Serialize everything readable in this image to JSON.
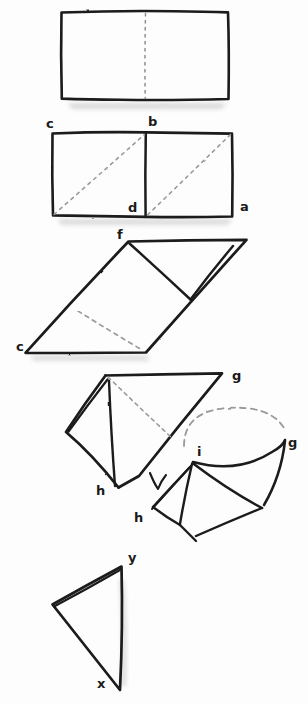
{
  "document": {
    "title": "Origami Fold Sequence",
    "medium": "hand-drawn pencil/ink diagram on white paper",
    "background_color": "#fdfdfd",
    "ink_color": "#1a1a1a",
    "dash_color": "#8a8a8a",
    "shadow_color": "#cfcfcf",
    "width": 308,
    "height": 704
  },
  "steps": [
    {
      "id": "step-1",
      "name": "flat-rectangle-with-center-crease",
      "caption": "",
      "labels": []
    },
    {
      "id": "step-2",
      "name": "rectangle-with-diagonal-creases",
      "caption": "",
      "labels": [
        {
          "text": "c",
          "x": 46,
          "y": 128
        },
        {
          "text": "b",
          "x": 148,
          "y": 126
        },
        {
          "text": "d",
          "x": 128,
          "y": 212
        },
        {
          "text": "a",
          "x": 240,
          "y": 211
        }
      ]
    },
    {
      "id": "step-3",
      "name": "parallelogram-skewed-fold",
      "caption": "",
      "labels": [
        {
          "text": "f",
          "x": 117,
          "y": 239
        },
        {
          "text": "c",
          "x": 16,
          "y": 351
        }
      ]
    },
    {
      "id": "step-4",
      "name": "triangular-flap-fold",
      "caption": "",
      "labels": [
        {
          "text": "g",
          "x": 232,
          "y": 380
        },
        {
          "text": "h",
          "x": 96,
          "y": 495
        }
      ]
    },
    {
      "id": "step-5",
      "name": "cone-rotation-step",
      "caption": "",
      "labels": [
        {
          "text": "g",
          "x": 288,
          "y": 447
        },
        {
          "text": "i",
          "x": 197,
          "y": 456
        },
        {
          "text": "h",
          "x": 134,
          "y": 522
        }
      ]
    },
    {
      "id": "step-6",
      "name": "final-triangle-form",
      "caption": "",
      "labels": [
        {
          "text": "y",
          "x": 128,
          "y": 562
        },
        {
          "text": "x",
          "x": 97,
          "y": 688
        }
      ]
    }
  ],
  "legend": {
    "solid_line_meaning": "cut or visible edge",
    "dashed_line_meaning": "fold crease / hidden edge",
    "arrow_meaning": "fold direction"
  }
}
